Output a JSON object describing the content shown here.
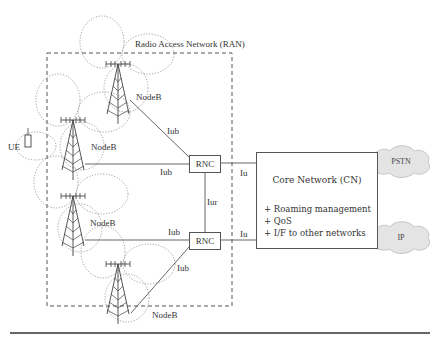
{
  "diagram": {
    "ran_label": "Radio Access Network (RAN)",
    "ue_label": "UE",
    "nodeb_labels": [
      "NodeB",
      "NodeB",
      "NodeB",
      "NodeB"
    ],
    "interfaces": {
      "iub": [
        "Iub",
        "Iub",
        "Iub",
        "Iub"
      ],
      "iur": "Iur",
      "iu": [
        "Iu",
        "Iu"
      ]
    },
    "rnc": [
      "RNC",
      "RNC"
    ],
    "core_network": {
      "title": "Core Network (CN)",
      "functions": [
        "+ Roaming management",
        "+ QoS",
        "+ I/F to other networks"
      ]
    },
    "external_networks": [
      "PSTN",
      "IP"
    ],
    "colors": {
      "line": "#555555",
      "dotted": "#888888",
      "cloud_fill": "#e4e4e4",
      "rule": "#333333"
    }
  }
}
